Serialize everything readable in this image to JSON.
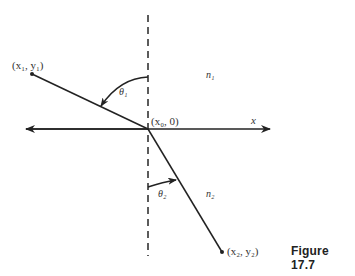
{
  "figure": {
    "caption": "Figure 17.7",
    "labels": {
      "p1": "(x₁, y₁)",
      "p0": "(x₀, 0)",
      "p2": "(x₂, y₂)",
      "x_axis": "x",
      "n1": "n₁",
      "n2": "n₂",
      "theta1": "θ₁",
      "theta2": "θ₂"
    },
    "geometry": {
      "normal_x": 148,
      "interface_y": 129,
      "point1": [
        32,
        74
      ],
      "origin": [
        148,
        129
      ],
      "point2": [
        222,
        252
      ]
    },
    "colors": {
      "ink": "#222222",
      "background": "#ffffff"
    }
  }
}
